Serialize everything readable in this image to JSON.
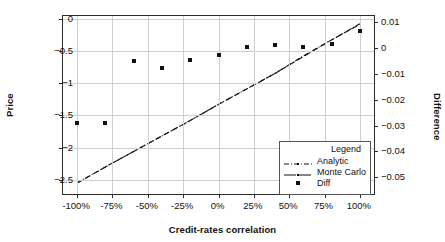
{
  "chart_data": {
    "type": "scatter",
    "title": "",
    "xlabel": "Credit-rates correlation",
    "ylabel": "Price",
    "y2label": "Difference",
    "grid": true,
    "legend_position": "bottom-right",
    "legend_title": "Legend",
    "x": [
      -100,
      -80,
      -60,
      -40,
      -20,
      0,
      20,
      40,
      60,
      80,
      100
    ],
    "xtick_labels": [
      "-100%",
      "-75%",
      "-50%",
      "-25%",
      "0%",
      "25%",
      "50%",
      "75%",
      "100%"
    ],
    "xtick_values": [
      -100,
      -75,
      -50,
      -25,
      0,
      25,
      50,
      75,
      100
    ],
    "xlim": [
      -110,
      110
    ],
    "ytick_labels": [
      "0",
      "-0.5",
      "-1",
      "-1.5",
      "-2",
      "-2.5"
    ],
    "ytick_values": [
      0,
      -0.5,
      -1,
      -1.5,
      -2,
      -2.5
    ],
    "ylim": [
      -2.72,
      0.04
    ],
    "y2tick_labels": [
      "0.01",
      "0",
      "-0.01",
      "-0.02",
      "-0.03",
      "-0.04",
      "-0.05"
    ],
    "y2tick_values": [
      0.01,
      0,
      -0.01,
      -0.02,
      -0.03,
      -0.04,
      -0.05
    ],
    "y2lim": [
      -0.0565,
      0.0124
    ],
    "series": [
      {
        "name": "Analytic",
        "axis": "left",
        "style": "dash-dot",
        "values": [
          -2.55,
          -2.3,
          -2.06,
          -1.82,
          -1.58,
          -1.33,
          -1.09,
          -0.85,
          -0.58,
          -0.33,
          -0.08
        ]
      },
      {
        "name": "Monte Carlo",
        "axis": "left",
        "style": "dashed",
        "values": [
          -2.55,
          -2.3,
          -2.06,
          -1.82,
          -1.58,
          -1.33,
          -1.09,
          -0.85,
          -0.59,
          -0.33,
          -0.09
        ]
      },
      {
        "name": "Diff",
        "axis": "right",
        "style": "square-marker",
        "values": [
          -0.0292,
          -0.0292,
          -0.0051,
          -0.0077,
          -0.0046,
          -0.0026,
          0.0004,
          0.0011,
          0.0004,
          0.0014,
          0.0065
        ]
      }
    ]
  }
}
